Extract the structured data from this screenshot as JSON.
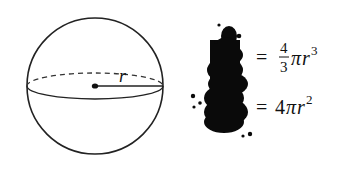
{
  "diagram": {
    "sphere": {
      "radius_label": "r"
    },
    "blob_icon": "ink-blot-icon",
    "formulas": [
      {
        "name": "volume",
        "equals": "=",
        "numerator": "4",
        "denominator": "3",
        "pi": "π",
        "var": "r",
        "exponent": "3"
      },
      {
        "name": "surface-area",
        "equals": "=",
        "coefficient": "4",
        "pi": "π",
        "var": "r",
        "exponent": "2"
      }
    ]
  }
}
